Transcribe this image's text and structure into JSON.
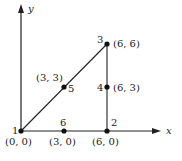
{
  "diagram": {
    "type": "mesh-graph",
    "axes": {
      "x_label": "x",
      "y_label": "y"
    },
    "nodes": [
      {
        "id": "1",
        "coord": "(0, 0)",
        "x": 0,
        "y": 0
      },
      {
        "id": "2",
        "coord": "(6, 0)",
        "x": 6,
        "y": 0
      },
      {
        "id": "3",
        "coord": "(6, 6)",
        "x": 6,
        "y": 6
      },
      {
        "id": "4",
        "coord": "(6, 3)",
        "x": 6,
        "y": 3
      },
      {
        "id": "5",
        "coord": "(3, 3)",
        "x": 3,
        "y": 3
      },
      {
        "id": "6",
        "coord": "(3, 0)",
        "x": 3,
        "y": 0
      }
    ],
    "edges": [
      [
        "1",
        "5"
      ],
      [
        "5",
        "3"
      ],
      [
        "3",
        "4"
      ],
      [
        "4",
        "2"
      ],
      [
        "2",
        "6"
      ],
      [
        "6",
        "1"
      ]
    ],
    "colors": {
      "ink": "#222222",
      "background": "#ffffff"
    }
  }
}
